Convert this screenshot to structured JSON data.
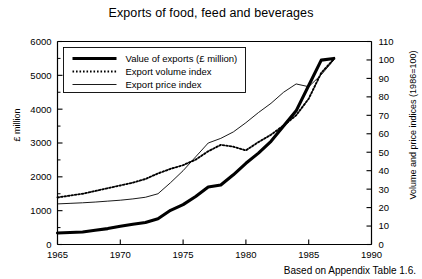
{
  "chart_data": {
    "type": "line",
    "title": "Exports of food, feed and beverages",
    "xlabel": "",
    "ylabel": "£ million",
    "ylabel_right": "Volume and price indices (1986=100)",
    "source_note": "Based on Appendix Table 1.6.",
    "grid": false,
    "legend_position": "upper-left-inside",
    "xlim": [
      1965,
      1990
    ],
    "xticks": [
      1965,
      1970,
      1975,
      1980,
      1985,
      1990
    ],
    "ylim": [
      0,
      6000
    ],
    "yticks": [
      0,
      1000,
      2000,
      3000,
      4000,
      5000,
      6000
    ],
    "ylim_right": [
      0,
      110
    ],
    "yticks_right": [
      0,
      10,
      20,
      30,
      40,
      50,
      60,
      70,
      80,
      90,
      100,
      110
    ],
    "x": [
      1965,
      1966,
      1967,
      1968,
      1969,
      1970,
      1971,
      1972,
      1973,
      1974,
      1975,
      1976,
      1977,
      1978,
      1979,
      1980,
      1981,
      1982,
      1983,
      1984,
      1985,
      1986,
      1987
    ],
    "series": [
      {
        "name": "Value of exports (£ million)",
        "axis": "left",
        "style": "thick-solid",
        "values": [
          340,
          355,
          370,
          420,
          470,
          540,
          600,
          650,
          760,
          1010,
          1180,
          1420,
          1700,
          1760,
          2060,
          2400,
          2700,
          3050,
          3500,
          3950,
          4700,
          5450,
          5500
        ]
      },
      {
        "name": "Export volume index",
        "axis": "right",
        "style": "dotted",
        "values": [
          25.5,
          26.5,
          27.5,
          29.0,
          30.5,
          32.0,
          33.5,
          35.5,
          38.5,
          41.0,
          43.0,
          46.0,
          50.5,
          54.0,
          53.0,
          51.0,
          55.5,
          59.5,
          64.5,
          70.0,
          79.0,
          93.0,
          100.5
        ]
      },
      {
        "name": "Export price index",
        "axis": "right",
        "style": "thin-solid",
        "values": [
          22.0,
          22.3,
          22.6,
          23.0,
          23.5,
          24.0,
          24.7,
          25.6,
          27.5,
          33.5,
          40.0,
          47.5,
          55.0,
          57.5,
          61.0,
          66.0,
          71.5,
          76.5,
          82.5,
          87.0,
          85.5,
          92.0,
          100.0
        ]
      }
    ]
  },
  "legend": {
    "items": [
      {
        "label": "Value of exports (£ million)",
        "style": "thick-solid"
      },
      {
        "label": "Export volume index",
        "style": "dotted"
      },
      {
        "label": "Export price index",
        "style": "thin-solid"
      }
    ]
  },
  "axis_labels": {
    "left_ticks": [
      "6000",
      "5000",
      "4000",
      "3000",
      "2000",
      "1000",
      "0"
    ],
    "right_ticks": [
      "110",
      "100",
      "90",
      "80",
      "70",
      "60",
      "50",
      "40",
      "30",
      "20",
      "10",
      "0"
    ],
    "x_ticks": [
      "1965",
      "1970",
      "1975",
      "1980",
      "1985",
      "1990"
    ]
  },
  "colors": {
    "ink": "#000000",
    "background": "#ffffff"
  }
}
